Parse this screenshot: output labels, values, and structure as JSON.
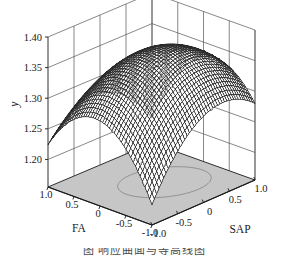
{
  "figure": {
    "background": "#ffffff",
    "surface_color": "#2b2b2b",
    "base_plane_color": "#c6c6c6",
    "axis_color": "#1a1a1a",
    "grid_color": "#555555",
    "contour_color": "#8a8a8a"
  },
  "caption": {
    "text": "图  响应曲面与等高线图",
    "visible": "partially cropped"
  },
  "chart_data": {
    "type": "surface",
    "title": "",
    "xlabel": "FA",
    "ylabel": "SAP",
    "zlabel": "y",
    "grid": true,
    "legend": "none",
    "xlim": [
      -1.0,
      1.0
    ],
    "ylim": [
      -1.0,
      1.0
    ],
    "zlim": [
      1.155,
      1.4
    ],
    "x_ticks": [
      "1.0",
      "0.5",
      "0",
      "-0.5",
      "-1.0"
    ],
    "x_tick_values": [
      1.0,
      0.5,
      0,
      -0.5,
      -1.0
    ],
    "y_ticks": [
      "-1.0",
      "-0.5",
      "0",
      "0.5",
      "1.0"
    ],
    "y_tick_values": [
      -1.0,
      -0.5,
      0,
      0.5,
      1.0
    ],
    "z_ticks": [
      "1.40",
      "1.35",
      "1.30",
      "1.25",
      "1.20"
    ],
    "z_tick_values": [
      1.4,
      1.35,
      1.3,
      1.25,
      1.2
    ],
    "model": {
      "form": "z = b0 + b1*x + b2*y + b11*x^2 + b22*y^2 + b12*x*y",
      "b0": 1.372,
      "b1": -0.012,
      "b2": 0.016,
      "b11": -0.088,
      "b22": -0.062,
      "b12": -0.03
    },
    "z_at_corners": {
      "FA=1.0,SAP=-1.0": 1.254,
      "FA=1.0,SAP=1.0": 1.226,
      "FA=-1.0,SAP=-1.0": 1.218,
      "FA=-1.0,SAP=1.0": 1.31,
      "FA=0,SAP=0": 1.372
    },
    "z_max": 1.374,
    "z_max_at": {
      "FA": -0.12,
      "SAP": 0.16
    },
    "base_plane_level": 1.155,
    "contour_levels": [
      1.35
    ],
    "mesh_density": 44,
    "view": {
      "azimuth_deg": -47,
      "elevation_deg": 22
    }
  },
  "axes": {
    "z_axis_label": "y",
    "x_axis_label": "FA",
    "y_axis_label": "SAP"
  }
}
